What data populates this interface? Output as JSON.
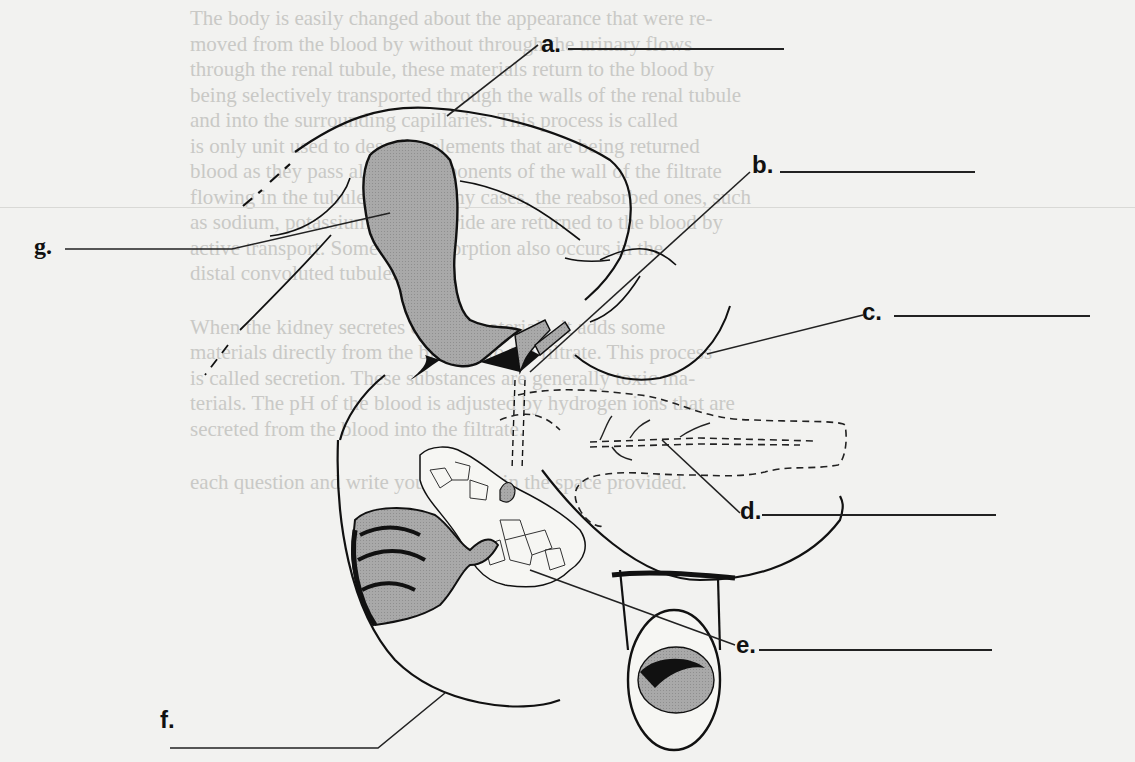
{
  "worksheet": {
    "title": "Digestive organs labeling diagram",
    "labels": [
      {
        "key": "a",
        "text": "a.",
        "answer": ""
      },
      {
        "key": "b",
        "text": "b.",
        "answer": ""
      },
      {
        "key": "c",
        "text": "c.",
        "answer": ""
      },
      {
        "key": "d",
        "text": "d.",
        "answer": ""
      },
      {
        "key": "e",
        "text": "e.",
        "answer": ""
      },
      {
        "key": "f",
        "text": "f.",
        "answer": ""
      },
      {
        "key": "g",
        "text": "g.",
        "answer": ""
      }
    ],
    "structures": [
      "liver",
      "gallbladder",
      "cystic duct",
      "common bile duct",
      "pancreas",
      "stomach",
      "duodenum",
      "pancreatic duct"
    ]
  },
  "show_through_text": {
    "lines": [
      "The body is easily changed about the appearance that were re-",
      "moved from the blood by without through the urinary flows",
      "through the renal tubule, these materials return to the blood by",
      "being selectively transported through the walls of the renal tubule",
      "and into the surrounding capillaries. This process is called",
      "is only unit used to describe elements that are being returned",
      "blood as they pass along. Components of the wall of the filtrate",
      "flowing in the tubule are, in many cases, the reabsorbed ones, such",
      "as sodium, potassium, and chloride are returned to the blood by",
      "active transport. Some of reabsorption also occurs in the",
      "distal convoluted tubule.",
      "When the kidney secretes certain materials, it adds some",
      "materials directly from the blood into the filtrate. This process",
      "is called secretion. These substances are generally toxic ma-",
      "terials. The pH of the blood is adjusted by hydrogen ions that are",
      "secreted from the blood into the filtrate.",
      "each question and write your answer in the space provided."
    ]
  }
}
